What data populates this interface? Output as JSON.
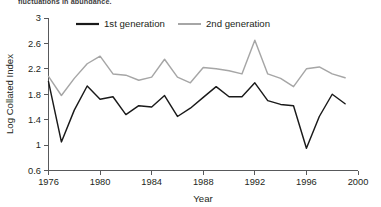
{
  "caption": {
    "text": "fluctuations in abundance."
  },
  "chart_data": {
    "type": "line",
    "title": "",
    "xlabel": "Year",
    "ylabel": "Log Collated Index",
    "xlim": [
      1976,
      2000
    ],
    "ylim": [
      0.6,
      3
    ],
    "xticks": [
      1976,
      1980,
      1984,
      1988,
      1992,
      1996,
      2000
    ],
    "xtick_labels": [
      "1976",
      "1980",
      "1984",
      "1988",
      "1992",
      "1996",
      "2000"
    ],
    "yticks": [
      0.6,
      1,
      1.4,
      1.8,
      2.2,
      2.6,
      3
    ],
    "ytick_labels": [
      "0.6",
      "1",
      "1.4",
      "1.8",
      "2.2",
      "2.6",
      "3"
    ],
    "grid": false,
    "legend_position": "top",
    "x": [
      1976,
      1977,
      1978,
      1979,
      1980,
      1981,
      1982,
      1983,
      1984,
      1985,
      1986,
      1987,
      1988,
      1989,
      1990,
      1991,
      1992,
      1993,
      1994,
      1995,
      1996,
      1997,
      1998,
      1999
    ],
    "series": [
      {
        "name": "1st generation",
        "color": "#1a1a1a",
        "values": [
          2.0,
          1.05,
          1.55,
          1.93,
          1.72,
          1.76,
          1.48,
          1.62,
          1.6,
          1.78,
          1.45,
          1.58,
          1.75,
          1.92,
          1.76,
          1.76,
          1.98,
          1.7,
          1.64,
          1.62,
          0.95,
          1.45,
          1.8,
          1.65
        ]
      },
      {
        "name": "2nd generation",
        "color": "#a6a6a6",
        "values": [
          2.08,
          1.78,
          2.05,
          2.28,
          2.4,
          2.12,
          2.1,
          2.02,
          2.07,
          2.35,
          2.07,
          1.98,
          2.22,
          2.2,
          2.17,
          2.12,
          2.65,
          2.12,
          2.05,
          1.92,
          2.2,
          2.23,
          2.12,
          2.06
        ]
      }
    ]
  },
  "legend": {
    "items": [
      {
        "label": "1st generation"
      },
      {
        "label": "2nd generation"
      }
    ]
  }
}
